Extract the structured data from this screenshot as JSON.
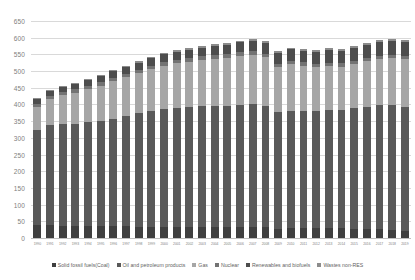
{
  "chart_data": {
    "type": "bar",
    "subtype": "stacked-column",
    "title": "",
    "xlabel": "",
    "ylabel": "",
    "ylim": [
      0,
      650
    ],
    "ytick_step": 50,
    "yticks": [
      0,
      50,
      100,
      150,
      200,
      250,
      300,
      350,
      400,
      450,
      500,
      550,
      600,
      650
    ],
    "grid": true,
    "legend_position": "bottom",
    "categories": [
      "1990",
      "1991",
      "1992",
      "1993",
      "1994",
      "1995",
      "1996",
      "1997",
      "1998",
      "1999",
      "2000",
      "2001",
      "2002",
      "2003",
      "2004",
      "2005",
      "2006",
      "2007",
      "2008",
      "2009",
      "2010",
      "2011",
      "2012",
      "2013",
      "2014",
      "2015",
      "2016",
      "2017",
      "2018",
      "2019"
    ],
    "series": [
      {
        "name": "Solid fossil fuels(Coal)",
        "color": "#3f3f3f",
        "values": [
          38,
          38,
          37,
          36,
          36,
          35,
          36,
          35,
          34,
          33,
          33,
          33,
          33,
          34,
          33,
          32,
          33,
          33,
          32,
          28,
          29,
          30,
          31,
          31,
          29,
          28,
          27,
          27,
          25,
          21
        ]
      },
      {
        "name": "Oil and petroleum products",
        "color": "#595959",
        "values": [
          287,
          300,
          305,
          307,
          311,
          315,
          322,
          330,
          340,
          347,
          352,
          356,
          358,
          360,
          362,
          364,
          366,
          368,
          364,
          350,
          352,
          350,
          348,
          352,
          354,
          360,
          366,
          370,
          372,
          372
        ]
      },
      {
        "name": "Gas",
        "color": "#a6a6a6",
        "values": [
          68,
          79,
          86,
          92,
          99,
          106,
          112,
          116,
          120,
          126,
          131,
          134,
          136,
          139,
          142,
          144,
          146,
          147,
          145,
          134,
          140,
          136,
          133,
          132,
          130,
          132,
          136,
          139,
          141,
          142
        ]
      },
      {
        "name": "Nuclear",
        "color": "#737373",
        "values": [
          10,
          10,
          10,
          10,
          10,
          10,
          10,
          10,
          10,
          10,
          11,
          11,
          11,
          11,
          11,
          11,
          11,
          11,
          11,
          10,
          10,
          10,
          10,
          10,
          10,
          10,
          10,
          10,
          10,
          10
        ]
      },
      {
        "name": "Renewables and biofuels",
        "color": "#4d4d4d",
        "values": [
          14,
          15,
          15,
          16,
          17,
          18,
          19,
          20,
          21,
          22,
          23,
          24,
          25,
          26,
          27,
          28,
          30,
          31,
          33,
          32,
          34,
          35,
          36,
          37,
          38,
          39,
          40,
          41,
          42,
          43
        ]
      },
      {
        "name": "Wastes non-RES",
        "color": "#8c8c8c",
        "values": [
          3,
          3,
          3,
          3,
          3,
          3,
          4,
          4,
          4,
          4,
          4,
          4,
          5,
          5,
          5,
          5,
          5,
          5,
          5,
          5,
          5,
          6,
          6,
          6,
          6,
          6,
          6,
          6,
          6,
          6
        ]
      }
    ],
    "totals": [
      420,
      445,
      456,
      464,
      476,
      487,
      503,
      515,
      529,
      542,
      554,
      562,
      568,
      575,
      580,
      584,
      591,
      595,
      590,
      559,
      570,
      567,
      564,
      568,
      567,
      575,
      585,
      593,
      596,
      594
    ]
  },
  "legend": {
    "items": [
      {
        "label": "Solid fossil fuels(Coal)",
        "color": "#3f3f3f"
      },
      {
        "label": "Oil and petroleum products",
        "color": "#595959"
      },
      {
        "label": "Gas",
        "color": "#a6a6a6"
      },
      {
        "label": "Nuclear",
        "color": "#737373"
      },
      {
        "label": "Renewables and biofuels",
        "color": "#4d4d4d"
      },
      {
        "label": "Wastes non-RES",
        "color": "#8c8c8c"
      }
    ]
  },
  "style": {
    "background": "#ffffff",
    "gridline_color": "#d9d9d9",
    "axis_text_color": "#808080"
  }
}
